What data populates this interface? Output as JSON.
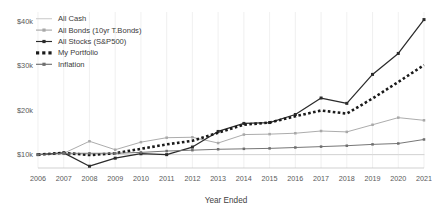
{
  "chart_data": {
    "type": "line",
    "title": "",
    "subtitle": "",
    "xlabel": "Year Ended",
    "ylabel": "",
    "grid": "vertical-light",
    "legend_position": "top-left",
    "x": [
      2006,
      2007,
      2008,
      2009,
      2010,
      2011,
      2012,
      2013,
      2014,
      2015,
      2016,
      2017,
      2018,
      2019,
      2020,
      2021
    ],
    "categories": [
      "2006",
      "2007",
      "2008",
      "2009",
      "2010",
      "2011",
      "2012",
      "2013",
      "2014",
      "2015",
      "2016",
      "2017",
      "2018",
      "2019",
      "2020",
      "2021"
    ],
    "xlim": [
      2006,
      2021
    ],
    "ylim": [
      7000,
      42000
    ],
    "ytick_values": [
      10000,
      20000,
      30000,
      40000
    ],
    "ytick_labels": [
      "$10k",
      "$20k",
      "$30k",
      "$40k"
    ],
    "series": [
      {
        "name": "All Cash",
        "color": "#cfcfcf",
        "marker": "none",
        "style": "solid",
        "values": [
          10000,
          10000,
          10000,
          10000,
          10000,
          10000,
          10000,
          10000,
          10000,
          10000,
          10000,
          10000,
          10000,
          10000,
          10000,
          10000
        ]
      },
      {
        "name": "All Bonds (10yr T.Bonds)",
        "color": "#a8a8a8",
        "marker": "square",
        "style": "solid",
        "values": [
          10000,
          10300,
          13000,
          11100,
          12800,
          13800,
          13900,
          12600,
          14500,
          14600,
          14800,
          15300,
          15100,
          16700,
          18300,
          17700
        ]
      },
      {
        "name": "All Stocks (S&P500)",
        "color": "#2b2b2b",
        "marker": "square",
        "style": "solid",
        "values": [
          10000,
          10400,
          7400,
          9200,
          10200,
          10000,
          11700,
          15200,
          17000,
          17200,
          19000,
          22700,
          21500,
          28000,
          32700,
          40300
        ]
      },
      {
        "name": "My Portfolio",
        "color": "#1a1a1a",
        "marker": "square",
        "style": "dotted",
        "values": [
          10000,
          10400,
          9900,
          10300,
          11300,
          12300,
          13100,
          14900,
          16700,
          17200,
          18600,
          19900,
          19200,
          22600,
          26300,
          30100
        ]
      },
      {
        "name": "Inflation",
        "color": "#6f6f6f",
        "marker": "square",
        "style": "solid",
        "values": [
          10000,
          10300,
          10300,
          10300,
          10500,
          10800,
          11000,
          11200,
          11300,
          11400,
          11600,
          11800,
          12000,
          12300,
          12500,
          13400
        ]
      }
    ]
  },
  "axis": {
    "x_title": "Year Ended",
    "y_tick_labels": [
      "$40k",
      "$30k",
      "$20k",
      "$10k"
    ],
    "x_tick_labels": [
      "2006",
      "2007",
      "2008",
      "2009",
      "2010",
      "2011",
      "2012",
      "2013",
      "2014",
      "2015",
      "2016",
      "2017",
      "2018",
      "2019",
      "2020",
      "2021"
    ]
  },
  "legend": {
    "items": [
      {
        "label": "All Cash",
        "color": "#cfcfcf",
        "marker": "none",
        "style": "solid"
      },
      {
        "label": "All Bonds (10yr T.Bonds)",
        "color": "#a8a8a8",
        "marker": "square",
        "style": "solid"
      },
      {
        "label": "All Stocks (S&P500)",
        "color": "#2b2b2b",
        "marker": "square",
        "style": "solid"
      },
      {
        "label": "My Portfolio",
        "color": "#1a1a1a",
        "marker": "square",
        "style": "dotted"
      },
      {
        "label": "Inflation",
        "color": "#6f6f6f",
        "marker": "square",
        "style": "solid"
      }
    ]
  }
}
